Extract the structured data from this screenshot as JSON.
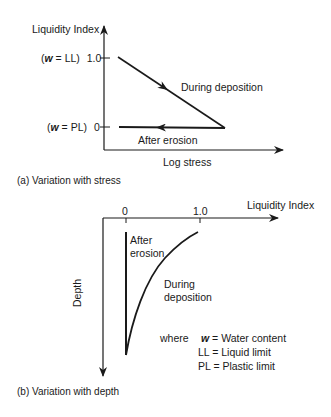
{
  "diagram_a": {
    "caption": "(a)  Variation with stress",
    "y_axis_label": "Liquidity Index",
    "x_axis_label": "Log stress",
    "tick_top": {
      "prefix": "(",
      "var": "w",
      "eq": " = LL)",
      "value": "1.0"
    },
    "tick_bottom": {
      "prefix": "(",
      "var": "w",
      "eq": " = PL)",
      "value": "0"
    },
    "deposition_label": "During deposition",
    "erosion_label": "After erosion"
  },
  "diagram_b": {
    "caption": "(b)  Variation with depth",
    "x_axis_label": "Liquidity Index",
    "y_axis_label": "Depth",
    "tick_left": "0",
    "tick_right": "1.0",
    "erosion_label_line1": "After",
    "erosion_label_line2": "erosion",
    "deposition_label_line1": "During",
    "deposition_label_line2": "deposition"
  },
  "legend": {
    "intro": "where",
    "entries": [
      {
        "symbol": "w",
        "definition": "= Water content"
      },
      {
        "symbol": "LL",
        "definition": "= Liquid limit"
      },
      {
        "symbol": "PL",
        "definition": "= Plastic limit"
      }
    ]
  },
  "colors": {
    "ink": "#1a1a1a",
    "background": "#ffffff"
  }
}
